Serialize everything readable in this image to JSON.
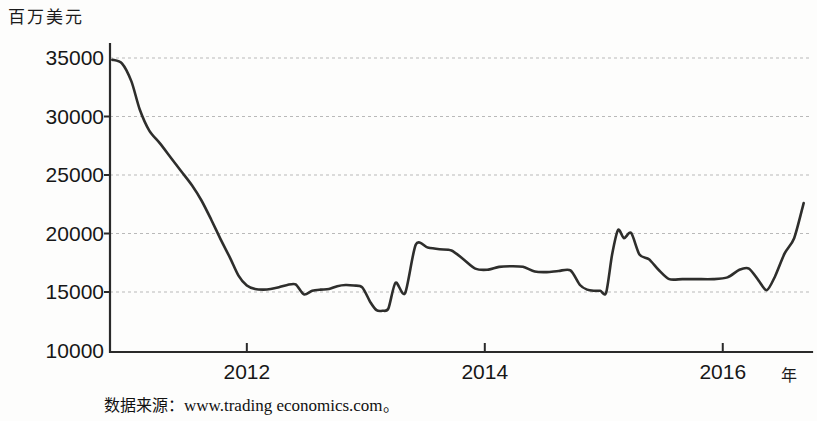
{
  "chart_data": {
    "type": "line",
    "title": "",
    "ylabel": "百万美元",
    "xlabel": "年",
    "ylim": [
      10000,
      35000
    ],
    "xlim": [
      2010.85,
      2016.75
    ],
    "grid": true,
    "legend": null,
    "y_ticks": [
      35000,
      30000,
      25000,
      20000,
      15000,
      10000
    ],
    "y_tick_labels": [
      "35000",
      "30000",
      "25000",
      "20000",
      "15000",
      "10000"
    ],
    "x_ticks": [
      2012,
      2014,
      2016
    ],
    "x_tick_labels": [
      "2012",
      "2014",
      "2016"
    ],
    "series": [
      {
        "name": "",
        "color": "#2e2e2c",
        "x": [
          2010.87,
          2010.95,
          2011.03,
          2011.1,
          2011.18,
          2011.27,
          2011.36,
          2011.45,
          2011.54,
          2011.62,
          2011.7,
          2011.78,
          2011.86,
          2011.93,
          2012.0,
          2012.07,
          2012.14,
          2012.2,
          2012.27,
          2012.34,
          2012.41,
          2012.48,
          2012.55,
          2012.62,
          2012.69,
          2012.76,
          2012.83,
          2012.9,
          2012.97,
          2013.04,
          2013.09,
          2013.14,
          2013.19,
          2013.25,
          2013.33,
          2013.42,
          2013.52,
          2013.62,
          2013.72,
          2013.82,
          2013.92,
          2014.02,
          2014.12,
          2014.22,
          2014.32,
          2014.42,
          2014.52,
          2014.62,
          2014.72,
          2014.8,
          2014.86,
          2014.92,
          2014.97,
          2015.02,
          2015.07,
          2015.12,
          2015.17,
          2015.23,
          2015.3,
          2015.38,
          2015.46,
          2015.55,
          2015.66,
          2015.78,
          2015.92,
          2016.04,
          2016.14,
          2016.22,
          2016.3,
          2016.37,
          2016.44,
          2016.52,
          2016.6,
          2016.68
        ],
        "y": [
          34850,
          34550,
          33000,
          30600,
          28800,
          27700,
          26500,
          25300,
          24100,
          22800,
          21200,
          19500,
          17900,
          16400,
          15550,
          15250,
          15200,
          15250,
          15400,
          15600,
          15650,
          14800,
          15100,
          15200,
          15250,
          15500,
          15600,
          15550,
          15400,
          14100,
          13450,
          13400,
          13600,
          15800,
          14900,
          19050,
          18800,
          18650,
          18550,
          17800,
          17000,
          16900,
          17150,
          17200,
          17150,
          16750,
          16700,
          16800,
          16850,
          15600,
          15200,
          15100,
          15100,
          14950,
          18200,
          20300,
          19600,
          20050,
          18200,
          17800,
          16900,
          16100,
          16100,
          16100,
          16100,
          16250,
          16900,
          17000,
          16000,
          15150,
          16350,
          18300,
          19600,
          22600
        ]
      }
    ]
  },
  "axes": {
    "y_unit_caption": "百万美元",
    "x_unit_caption": "年"
  },
  "footer": {
    "source_prefix": "数据来源：",
    "source_url": "www.trading economics.com",
    "source_suffix": "。"
  }
}
